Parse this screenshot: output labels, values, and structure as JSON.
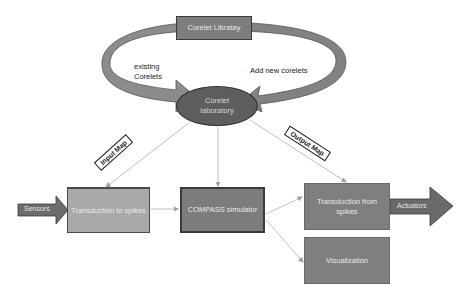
{
  "diagram": {
    "nodes": {
      "corelet_library": "Corelet Libratay",
      "corelet_laboratory_line1": "Corelet",
      "corelet_laboratory_line2": "laboratory",
      "transduction_to_spikes": "Transduction to spikes",
      "compass_simulator": "COMPASS simulator",
      "transduction_from_spikes_line1": "Transduction from",
      "transduction_from_spikes_line2": "spikes",
      "visualization": "Visualization"
    },
    "io_arrows": {
      "sensors": "Sensors",
      "actuators": "Actuators"
    },
    "cycle_labels": {
      "existing_line1": "existing",
      "existing_line2": "Corelets",
      "add_new": "Add new corelets"
    },
    "map_tags": {
      "input_map": "Input Map",
      "output_map": "Output Map"
    },
    "edges": [
      {
        "from": "Corelet laboratory",
        "to": "Transduction to spikes",
        "label": "Input Map"
      },
      {
        "from": "Corelet laboratory",
        "to": "COMPASS simulator",
        "label": ""
      },
      {
        "from": "Corelet laboratory",
        "to": "Transduction from spikes",
        "label": "Output Map"
      },
      {
        "from": "Transduction to spikes",
        "to": "COMPASS simulator",
        "label": ""
      },
      {
        "from": "COMPASS simulator",
        "to": "Transduction from spikes",
        "label": ""
      },
      {
        "from": "COMPASS simulator",
        "to": "Visualization",
        "label": ""
      },
      {
        "from": "Corelet Libratay",
        "to": "Corelet laboratory",
        "label": "existing Corelets"
      },
      {
        "from": "Corelet laboratory",
        "to": "Corelet Libratay",
        "label": "Add new corelets"
      }
    ],
    "colors": {
      "dark_box": "#7c7c7c",
      "light_box": "#a9a9a9",
      "ellipse": "#5e5e5e",
      "curved_arrow": "#8a8a8a",
      "connector": "#b5b5b5"
    }
  }
}
